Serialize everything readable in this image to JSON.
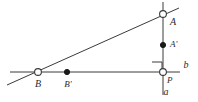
{
  "figure": {
    "type": "geometry-diagram",
    "background_color": "#ffffff",
    "stroke_color": "#3a3a3a",
    "label_color": "#2b2b2b",
    "lines": [
      {
        "name": "line-b-horizontal",
        "label": "b",
        "x1": 10,
        "y1": 72,
        "x2": 180,
        "y2": 72
      },
      {
        "name": "line-a-vertical",
        "label": "a",
        "x1": 163,
        "y1": 2,
        "x2": 163,
        "y2": 95
      },
      {
        "name": "transversal-line",
        "label": "",
        "x1": 7,
        "y1": 85,
        "x2": 179,
        "y2": 8
      }
    ],
    "points": [
      {
        "name": "point-A",
        "label": "A",
        "x": 163,
        "y": 14,
        "style": "open",
        "label_dx": 7,
        "label_dy": 9
      },
      {
        "name": "point-A-prime",
        "label": "A'",
        "x": 163,
        "y": 45,
        "style": "filled",
        "label_dx": 7,
        "label_dy": 0
      },
      {
        "name": "point-B",
        "label": "B",
        "x": 38,
        "y": 72,
        "style": "open",
        "label_dx": 0,
        "label_dy": 13
      },
      {
        "name": "point-B-prime",
        "label": "B'",
        "x": 67,
        "y": 72,
        "style": "filled",
        "label_dx": 0,
        "label_dy": 13
      },
      {
        "name": "point-P",
        "label": "P",
        "x": 163,
        "y": 72,
        "style": "open",
        "label_dx": 7,
        "label_dy": 9
      }
    ],
    "axis_labels": [
      {
        "name": "axis-label-b",
        "label": "b",
        "x": 186,
        "y": 66
      },
      {
        "name": "axis-label-a",
        "label": "a",
        "x": 166,
        "y": 92
      }
    ],
    "right_angle_marker": {
      "name": "right-angle-marker",
      "x": 152,
      "y": 62,
      "size": 10
    }
  }
}
